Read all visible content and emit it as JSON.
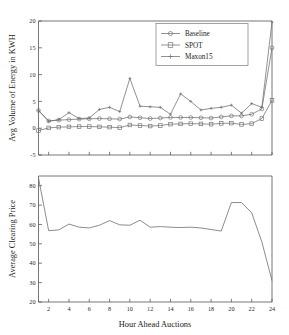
{
  "figure": {
    "xlabel": "Hour Ahead Auctions",
    "background": "#ffffff",
    "line_color": "#6e6e6e",
    "text_color": "#1a1a1a"
  },
  "chart_data": [
    {
      "type": "line",
      "panel": "top",
      "title": "",
      "xlabel": "",
      "ylabel": "Avg Volume of Energy in KWH",
      "xlim": [
        1,
        24
      ],
      "ylim": [
        -5,
        20
      ],
      "yticks": [
        -5,
        0,
        5,
        10,
        15,
        20
      ],
      "xticks": [
        2,
        4,
        6,
        8,
        10,
        12,
        14,
        16,
        18,
        20,
        22,
        24
      ],
      "xticklabels_visible": false,
      "grid": false,
      "legend_position": "upper right",
      "x": [
        1,
        2,
        3,
        4,
        5,
        6,
        7,
        8,
        9,
        10,
        11,
        12,
        13,
        14,
        15,
        16,
        17,
        18,
        19,
        20,
        21,
        22,
        23,
        24
      ],
      "series": [
        {
          "name": "Baseline",
          "marker": "circle",
          "values": [
            3.3,
            1.35,
            1.5,
            1.6,
            1.7,
            1.75,
            1.8,
            1.75,
            1.7,
            2.1,
            1.95,
            1.8,
            1.9,
            2.0,
            2.0,
            2.0,
            1.95,
            1.9,
            2.1,
            2.3,
            2.3,
            2.6,
            3.6,
            15.0
          ]
        },
        {
          "name": "SPOT",
          "marker": "square",
          "values": [
            -0.45,
            0.05,
            0.2,
            0.25,
            0.3,
            0.3,
            0.25,
            0.2,
            0.1,
            0.6,
            0.5,
            0.4,
            0.5,
            0.75,
            0.8,
            0.85,
            0.8,
            0.75,
            0.9,
            0.95,
            0.7,
            0.85,
            1.8,
            5.2
          ]
        },
        {
          "name": "Maxon15",
          "marker": "plus",
          "values": [
            3.3,
            1.3,
            1.6,
            2.9,
            1.8,
            1.9,
            3.5,
            3.9,
            3.1,
            9.3,
            4.1,
            4.0,
            3.9,
            2.6,
            6.4,
            5.0,
            3.4,
            3.7,
            3.9,
            4.3,
            2.8,
            4.6,
            3.9,
            19.8
          ]
        }
      ]
    },
    {
      "type": "line",
      "panel": "bottom",
      "title": "",
      "xlabel": "Hour Ahead Auctions",
      "ylabel": "Average Clearing Price",
      "xlim": [
        1,
        24
      ],
      "ylim": [
        20,
        85
      ],
      "yticks": [
        20,
        30,
        40,
        50,
        60,
        70,
        80
      ],
      "xticks": [
        2,
        4,
        6,
        8,
        10,
        12,
        14,
        16,
        18,
        20,
        22,
        24
      ],
      "grid": false,
      "x": [
        1,
        2,
        3,
        4,
        5,
        6,
        7,
        8,
        9,
        10,
        11,
        12,
        13,
        14,
        15,
        16,
        17,
        18,
        19,
        20,
        21,
        22,
        23,
        24
      ],
      "series": [
        {
          "name": "Average Clearing Price",
          "marker": "none",
          "values": [
            84.0,
            56.8,
            57.2,
            60.2,
            58.6,
            58.2,
            59.6,
            62.0,
            59.8,
            59.6,
            62.2,
            58.6,
            58.9,
            58.6,
            58.4,
            58.6,
            58.2,
            57.4,
            56.6,
            71.3,
            71.3,
            66.0,
            51.0,
            31.0
          ]
        }
      ]
    }
  ],
  "legend": {
    "items": [
      {
        "label": "Baseline",
        "marker": "circle"
      },
      {
        "label": "SPOT",
        "marker": "square"
      },
      {
        "label": "Maxon15",
        "marker": "plus"
      }
    ]
  }
}
